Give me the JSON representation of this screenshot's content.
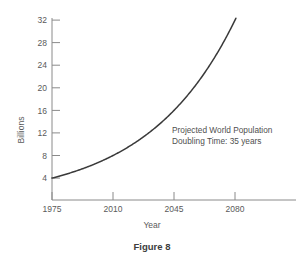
{
  "figure": {
    "caption": "Figure 8",
    "background_color": "#ffffff",
    "axis_color": "#8a8a8a",
    "curve_color": "#3a3a3a",
    "text_color": "#5a5a5a"
  },
  "chart_data": {
    "type": "line",
    "title": "",
    "xlabel": "Year",
    "ylabel": "Billions",
    "xlim": [
      1975,
      2092
    ],
    "ylim": [
      0,
      33.5
    ],
    "xticks": [
      1975,
      2010,
      2045,
      2080
    ],
    "xtick_labels": [
      "1975",
      "2010",
      "2045",
      "2080"
    ],
    "yticks": [
      4,
      8,
      12,
      16,
      20,
      24,
      28,
      32
    ],
    "ytick_labels": [
      "4",
      "8",
      "12",
      "16",
      "20",
      "24",
      "28",
      "32"
    ],
    "grid": false,
    "legend": null,
    "annotations": [
      {
        "line1": "Projected World Population",
        "line2": "Doubling Time:  35 years"
      }
    ],
    "series": [
      {
        "name": "Projected World Population",
        "formula": "4 x 2^((year-1975)/35)",
        "x": [
          1975,
          1985,
          1995,
          2005,
          2015,
          2025,
          2035,
          2045,
          2055,
          2065,
          2075,
          2085
        ],
        "values": [
          4.0,
          4.9,
          6.0,
          7.4,
          9.1,
          11.1,
          13.6,
          16.7,
          20.5,
          25.1,
          30.7,
          31.5
        ]
      }
    ]
  }
}
